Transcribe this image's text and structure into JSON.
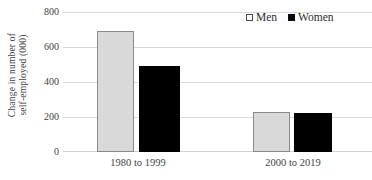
{
  "chart_data": {
    "type": "bar",
    "title": "",
    "subtitle": "",
    "xlabel": "",
    "ylabel_line1": "Change in number of",
    "ylabel_line2": "self-employed (000)",
    "ylabel": "Change in number of self-employed (000)",
    "categories": [
      "1980 to 1999",
      "2000 to 2019"
    ],
    "series": [
      {
        "name": "Men",
        "values": [
          690,
          228
        ],
        "color": "#d9d9d9",
        "border_color": "#8a8a8a"
      },
      {
        "name": "Women",
        "values": [
          490,
          222
        ],
        "color": "#000000",
        "border_color": "#000000"
      }
    ],
    "ylim": [
      0,
      800
    ],
    "yticks": [
      800,
      600,
      400,
      200,
      0
    ],
    "ytick_labels": [
      "800",
      "600",
      "400",
      "200",
      "0"
    ],
    "grid": "horizontal",
    "legend_position": "top-right",
    "legend_entries": [
      "Men",
      "Women"
    ],
    "legend_markers": [
      "open-square",
      "filled-square"
    ],
    "annotations": []
  }
}
